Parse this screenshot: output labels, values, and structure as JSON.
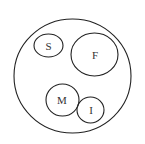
{
  "diagram": {
    "type": "venn",
    "universe": {
      "label": "",
      "cx": 72.5,
      "cy": 76,
      "rx": 58.5,
      "ry": 57
    },
    "sets": [
      {
        "id": "S",
        "label": "S",
        "cx": 48.5,
        "cy": 45.5,
        "rx": 14.5,
        "ry": 11.5
      },
      {
        "id": "F",
        "label": "F",
        "cx": 94.5,
        "cy": 54.5,
        "rx": 23.5,
        "ry": 21.5
      },
      {
        "id": "M",
        "label": "M",
        "cx": 62.5,
        "cy": 100,
        "rx": 16.5,
        "ry": 16
      },
      {
        "id": "I",
        "label": "I",
        "cx": 90.5,
        "cy": 110,
        "rx": 13.5,
        "ry": 13
      }
    ],
    "colors": {
      "stroke": "#222222",
      "text": "#333333",
      "background": "#ffffff"
    }
  }
}
